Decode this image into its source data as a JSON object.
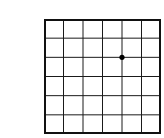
{
  "grid": {
    "columns": 6,
    "rows": 6,
    "line_color": "#1a1a1a",
    "border_color": "#111111",
    "background": "#ffffff",
    "dot": {
      "column_line": 4,
      "row_line": 2,
      "color": "#000000",
      "radius": 2.6
    }
  }
}
